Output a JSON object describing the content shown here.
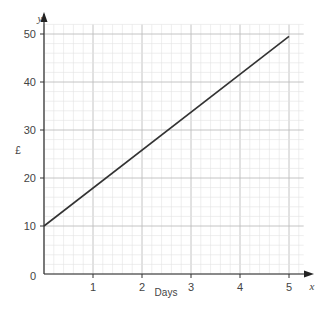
{
  "chart_data": {
    "type": "line",
    "title": "",
    "xlabel": "Days",
    "ylabel": "£",
    "x_axis_symbol": "x",
    "y_axis_symbol": "y",
    "xlim": [
      0,
      5.3
    ],
    "ylim": [
      0,
      52
    ],
    "x_ticks": [
      "1",
      "2",
      "3",
      "4",
      "5"
    ],
    "y_ticks": [
      "0",
      "10",
      "20",
      "30",
      "40",
      "50"
    ],
    "grid": true,
    "grid_minor_x": 0.2,
    "grid_minor_y": 2,
    "series": [
      {
        "name": "cost",
        "x": [
          0,
          5
        ],
        "y": [
          10,
          49.5
        ],
        "color": "#333333"
      }
    ]
  }
}
